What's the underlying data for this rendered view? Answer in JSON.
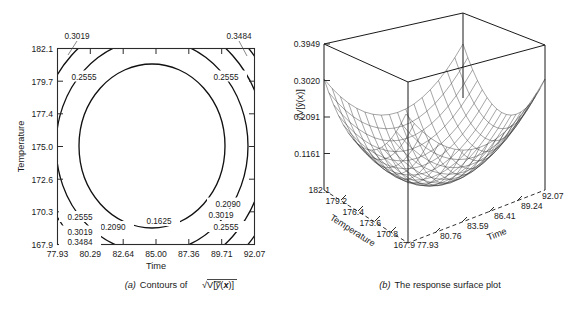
{
  "figure": {
    "background": "#ffffff",
    "line_color": "#111111"
  },
  "panel_a": {
    "caption_prefix": "(a)",
    "caption_text": "Contours of",
    "caption_expr": "√V[ȳ(x)]",
    "x_axis_title": "Time",
    "y_axis_title": "Temperature"
  },
  "panel_b": {
    "caption_prefix": "(b)",
    "caption_text": "The response surface plot",
    "x_axis_title": "Time",
    "y_axis_title": "Temperature",
    "z_axis_title": "√V[ŷ(x)]"
  },
  "chart_data": [
    {
      "type": "contour",
      "id": "panel-a",
      "title": "(a) Contours of √V[ȳ(x)]",
      "xlabel": "Time",
      "ylabel": "Temperature",
      "xlim": [
        77.93,
        92.07
      ],
      "ylim": [
        167.9,
        182.1
      ],
      "grid": false,
      "xticks": [
        "77.93",
        "80.29",
        "82.64",
        "85.00",
        "87.36",
        "89.71",
        "92.07"
      ],
      "yticks": [
        "182.1",
        "179.7",
        "177.4",
        "175.0",
        "172.6",
        "170.3",
        "167.9"
      ],
      "contour_levels": [
        0.1625,
        0.209,
        0.2555,
        0.3019,
        0.3484
      ],
      "contour_labels": [
        {
          "value": "0.3019",
          "position": "top-left-outside",
          "leader": true
        },
        {
          "value": "0.3484",
          "position": "top-right-outside",
          "leader": true
        },
        {
          "value": "0.2555",
          "position": "upper-left"
        },
        {
          "value": "0.2555",
          "position": "upper-right"
        },
        {
          "value": "0.1625",
          "position": "bottom-center-inner"
        },
        {
          "value": "0.2090",
          "position": "bottom-left"
        },
        {
          "value": "0.2555",
          "position": "lower-left"
        },
        {
          "value": "0.3019",
          "position": "lower-left"
        },
        {
          "value": "0.3484",
          "position": "lower-left-corner"
        },
        {
          "value": "0.2090",
          "position": "lower-right"
        },
        {
          "value": "0.3019",
          "position": "lower-right"
        },
        {
          "value": "0.2555",
          "position": "lower-right-lower"
        }
      ],
      "center": {
        "Time": 85.0,
        "Temperature": 175.0
      },
      "description": "Nested elliptical contours of the square root of the prediction variance; minimum 0.1625 at the design center, increasing outward to 0.3484 at the corners."
    },
    {
      "type": "surface",
      "id": "panel-b",
      "title": "(b) The response surface plot",
      "xlabel": "Time",
      "ylabel": "Temperature",
      "zlabel": "√V[ŷ(x)]",
      "xlim": [
        77.93,
        92.07
      ],
      "ylim": [
        167.9,
        182.1
      ],
      "zlim": [
        0.1161,
        0.3949
      ],
      "xticks": [
        "77.93",
        "80.76",
        "83.59",
        "86.41",
        "89.24",
        "92.07"
      ],
      "yticks": [
        "182.1",
        "179.2",
        "176.4",
        "173.6",
        "170.8",
        "167.9"
      ],
      "zticks": [
        "0.3949",
        "0.3020",
        "0.2091",
        "0.1161"
      ],
      "mesh": {
        "rows": 17,
        "cols": 17,
        "wireframe": true
      },
      "description": "Bowl-shaped (paraboloid) wireframe surface of the square root of the prediction variance over Time and Temperature, minimum near the center, rising toward all four corners."
    }
  ]
}
